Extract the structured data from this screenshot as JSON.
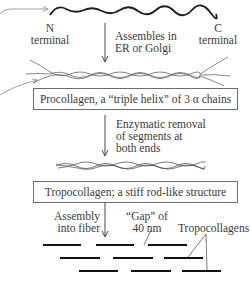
{
  "diagram": {
    "chain": {
      "n_label_line1": "N",
      "n_label_line2": "terminal",
      "c_label_line1": "C",
      "c_label_line2": "terminal"
    },
    "step1": {
      "line1": "Assembles in",
      "line2": "ER or Golgi"
    },
    "procollagen_box": "Procollagen, a “triple helix” of 3 α chains",
    "step2": {
      "line1": "Enzymatic removal",
      "line2": "of segments at",
      "line3": "both ends"
    },
    "tropocollagen_box": "Tropocollagen; a stiff rod-like structure",
    "step3": {
      "line1": "Assembly",
      "line2": "into fiber"
    },
    "gap_label": {
      "line1": "“Gap” of",
      "line2": "40 nm"
    },
    "tropocollagens_label": "Tropocollagens",
    "colors": {
      "line": "#2b2b2b",
      "pointer": "#8a8a8a",
      "box_border": "#6d6d6d"
    }
  }
}
